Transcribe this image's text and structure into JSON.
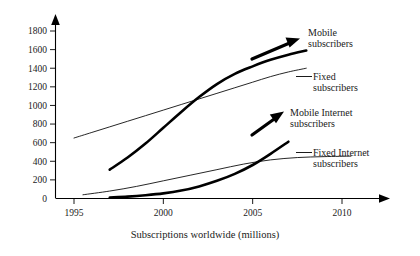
{
  "chart_data": {
    "type": "line",
    "title": "",
    "xlabel": "Subscriptions worldwide (millions)",
    "ylabel": "",
    "xlim": [
      1994,
      2011
    ],
    "ylim": [
      0,
      1900
    ],
    "grid": false,
    "legend_position": "inline-right-annotations",
    "xticks": [
      "1995",
      "2000",
      "2005",
      "2010"
    ],
    "xtick_values": [
      1995,
      2000,
      2005,
      2010
    ],
    "yticks": [
      "0",
      "200",
      "400",
      "600",
      "800",
      "1000",
      "1200",
      "1400",
      "1600",
      "1800"
    ],
    "ytick_values": [
      0,
      200,
      400,
      600,
      800,
      1000,
      1200,
      1400,
      1600,
      1800
    ],
    "series": [
      {
        "name": "Mobile subscribers",
        "style": "bold",
        "color": "#000000",
        "x": [
          1997.0,
          1998.0,
          1999.0,
          2000.0,
          2001.0,
          2002.0,
          2003.0,
          2004.0,
          2005.0,
          2006.0,
          2007.0,
          2008.0
        ],
        "values": [
          310,
          440,
          590,
          760,
          930,
          1090,
          1230,
          1340,
          1420,
          1490,
          1545,
          1590
        ]
      },
      {
        "name": "Fixed subscribers",
        "style": "thin",
        "color": "#000000",
        "x": [
          1995.0,
          1996.0,
          1997.0,
          1998.0,
          1999.0,
          2000.0,
          2001.0,
          2002.0,
          2003.0,
          2004.0,
          2005.0,
          2006.0,
          2007.0,
          2008.0
        ],
        "values": [
          650,
          710,
          770,
          830,
          890,
          950,
          1010,
          1070,
          1130,
          1190,
          1250,
          1310,
          1360,
          1400
        ]
      },
      {
        "name": "Mobile Internet subscribers",
        "style": "bold",
        "color": "#000000",
        "x": [
          1997.0,
          1998.0,
          1999.0,
          2000.0,
          2001.0,
          2002.0,
          2003.0,
          2004.0,
          2005.0,
          2006.0,
          2007.0
        ],
        "values": [
          10,
          20,
          35,
          55,
          85,
          130,
          190,
          265,
          360,
          480,
          610
        ]
      },
      {
        "name": "Fixed Internet subscribers",
        "style": "thin",
        "color": "#000000",
        "x": [
          1995.5,
          1997.0,
          1998.5,
          2000.0,
          2001.5,
          2003.0,
          2004.5,
          2006.0,
          2007.5,
          2009.0,
          2010.5
        ],
        "values": [
          40,
          80,
          130,
          190,
          250,
          310,
          370,
          415,
          440,
          450,
          455
        ]
      }
    ],
    "annotations": [
      {
        "name": "mobile-subscribers-arrow",
        "label": "Mobile subscribers",
        "style": "bold-arrow"
      },
      {
        "name": "fixed-subscribers-leader",
        "label": "Fixed subscribers",
        "style": "thin-leader"
      },
      {
        "name": "mobile-internet-subscribers-arrow",
        "label": "Mobile Internet subscribers",
        "style": "bold-arrow"
      },
      {
        "name": "fixed-internet-subscribers-leader",
        "label": "Fixed Internet subscribers",
        "style": "thin-leader"
      }
    ]
  },
  "labels": {
    "mobile_line1": "Mobile",
    "mobile_line2": "subscribers",
    "fixed_line1": "Fixed",
    "fixed_line2": "subscribers",
    "mobile_internet_line1": "Mobile Internet",
    "mobile_internet_line2": "subscribers",
    "fixed_internet_line1": "Fixed Internet",
    "fixed_internet_line2": "subscribers"
  },
  "axis": {
    "x_title": "Subscriptions worldwide (millions)"
  }
}
